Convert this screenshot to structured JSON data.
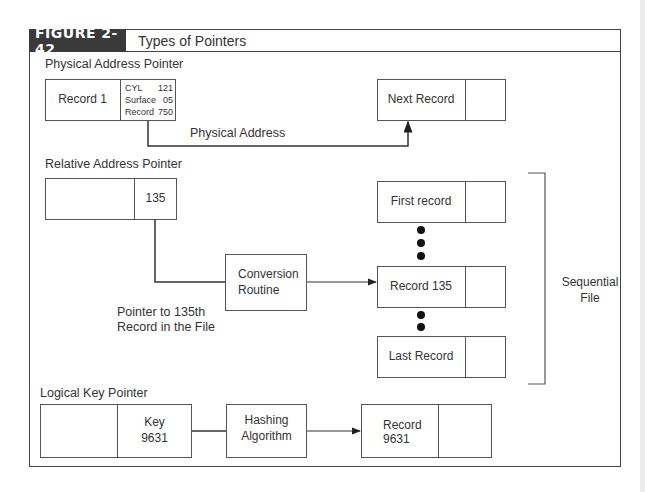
{
  "figure": {
    "number": "FIGURE 2-42",
    "title": "Types of Pointers"
  },
  "physical": {
    "heading": "Physical Address Pointer",
    "record_label": "Record 1",
    "address_rows": [
      {
        "key": "CYL",
        "value": "121"
      },
      {
        "key": "Surface",
        "value": "05"
      },
      {
        "key": "Record",
        "value": "750"
      }
    ],
    "target_label": "Next Record",
    "link_label": "Physical Address"
  },
  "relative": {
    "heading": "Relative Address Pointer",
    "pointer_value": "135",
    "routine_label": "Conversion Routine",
    "note_line1": "Pointer to 135th",
    "note_line2": "Record in the File",
    "records": [
      "First record",
      "Record 135",
      "Last Record"
    ],
    "group_label_line1": "Sequential",
    "group_label_line2": "File"
  },
  "logical": {
    "heading": "Logical Key Pointer",
    "key_line1": "Key",
    "key_line2": "9631",
    "algorithm_line1": "Hashing",
    "algorithm_line2": "Algorithm",
    "record_line1": "Record",
    "record_line2": "9631"
  }
}
